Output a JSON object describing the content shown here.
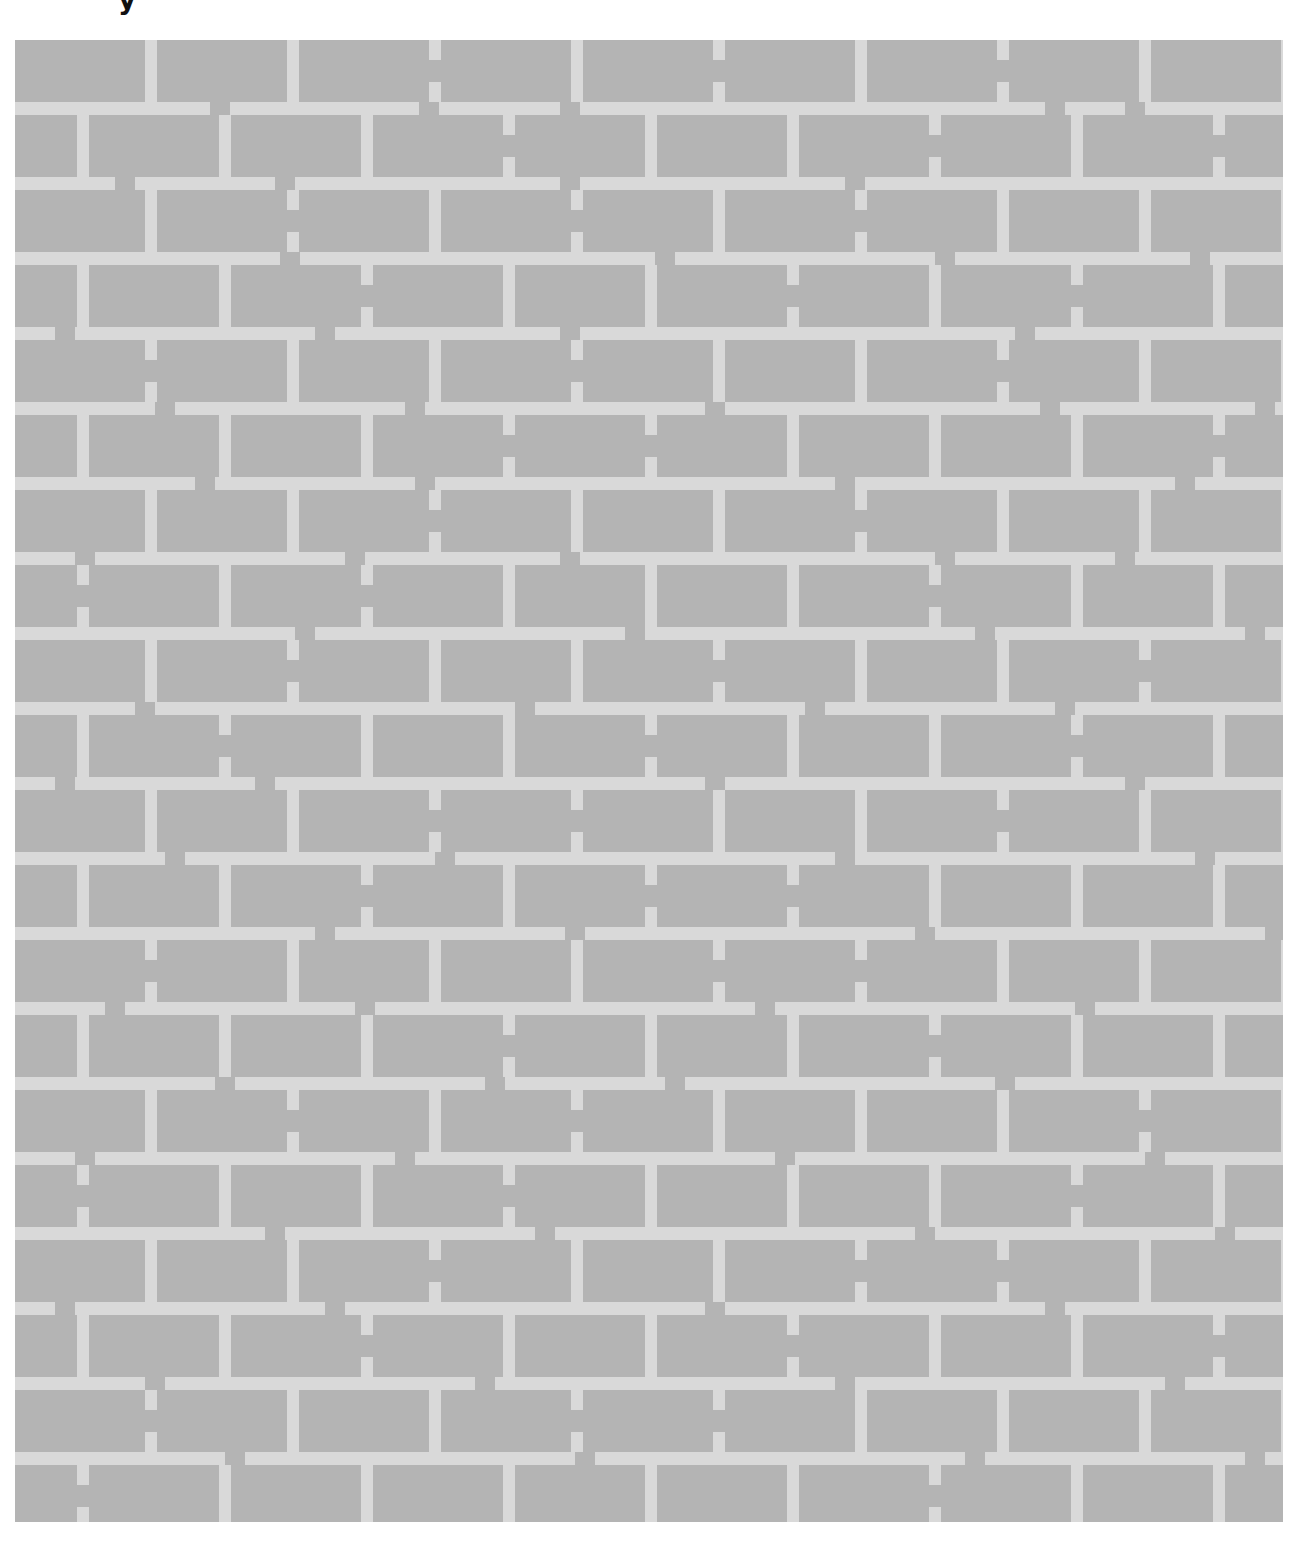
{
  "caption_fragment": "y",
  "figure": {
    "type": "brick-wall-maze-illusion",
    "colors": {
      "brick": "#b4b4b4",
      "mortar": "#d9d9d9",
      "background": "#ffffff"
    },
    "wall": {
      "x": 15,
      "y": 40,
      "width": 1268,
      "height": 1482
    },
    "row_pitch": 75,
    "brick_height": 62,
    "mortar_thickness": 13,
    "joint_pitch": 142,
    "joint_width": 12,
    "even_row_first_joint_x": 130,
    "odd_row_first_joint_x": 62,
    "row_count": 20,
    "hband_gap_width": 20,
    "vjoint_gap_height": 22,
    "hband_gaps": [
      [
        195,
        404,
        545,
        1030,
        1110
      ],
      [
        100,
        260,
        545,
        830
      ],
      [
        265,
        640,
        920,
        1175
      ],
      [
        40,
        300,
        545,
        1000
      ],
      [
        140,
        390,
        690,
        1025,
        1240
      ],
      [
        180,
        400,
        820,
        1160
      ],
      [
        60,
        330,
        545,
        920,
        1100
      ],
      [
        280,
        610,
        960,
        1230
      ],
      [
        120,
        500,
        790,
        1040
      ],
      [
        40,
        240,
        690,
        1110
      ],
      [
        150,
        420,
        820,
        1180
      ],
      [
        300,
        550,
        900,
        1250
      ],
      [
        90,
        340,
        740,
        1060
      ],
      [
        200,
        470,
        650,
        980
      ],
      [
        60,
        380,
        760,
        1130
      ],
      [
        250,
        520,
        900,
        1200
      ],
      [
        40,
        310,
        690,
        1030
      ],
      [
        130,
        460,
        820,
        1150
      ],
      [
        210,
        560,
        950,
        1230
      ]
    ],
    "broken_vjoints": [
      [
        414,
        698,
        982
      ],
      [
        488,
        914,
        1198
      ],
      [
        272,
        556,
        840
      ],
      [
        346,
        772,
        1056
      ],
      [
        130,
        556,
        982
      ],
      [
        488,
        630,
        1198
      ],
      [
        414,
        840
      ],
      [
        62,
        346,
        914
      ],
      [
        272,
        698,
        1124
      ],
      [
        204,
        630,
        1056
      ],
      [
        414,
        556,
        982
      ],
      [
        346,
        630,
        772
      ],
      [
        130,
        698,
        840
      ],
      [
        488,
        914
      ],
      [
        272,
        556,
        1124
      ],
      [
        62,
        488,
        1056
      ],
      [
        414,
        840,
        982
      ],
      [
        346,
        772,
        1198
      ],
      [
        130,
        556,
        698
      ],
      [
        62,
        914
      ]
    ]
  }
}
